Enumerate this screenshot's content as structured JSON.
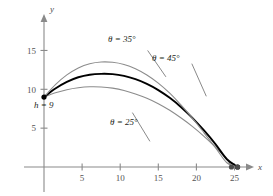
{
  "figure": {
    "axis_x_label": "x",
    "axis_y_label": "y",
    "axis_color": "#808080",
    "curve_highlight_color": "#000000",
    "curve_secondary_color": "#8c8c8c"
  },
  "annotations": {
    "height_label": "h = 9",
    "theta35": "θ = 35°",
    "theta45": "θ = 45°",
    "theta25": "θ = 25°"
  },
  "chart_data": {
    "type": "line",
    "title": "",
    "xlabel": "x",
    "ylabel": "y",
    "xlim": [
      0,
      27.5
    ],
    "ylim": [
      0,
      17.5
    ],
    "xticks": [
      5,
      10,
      15,
      20,
      25
    ],
    "yticks": [
      5,
      10,
      15
    ],
    "xtick_labels": [
      "5",
      "10",
      "15",
      "20",
      "25"
    ],
    "ytick_labels": [
      "5",
      "10",
      "15"
    ],
    "grid": false,
    "legend": "inline-annotations",
    "initial_height": 9,
    "series": [
      {
        "name": "θ = 25°",
        "color": "#8c8c8c",
        "emphasis": false,
        "x": [
          0,
          1.5,
          3,
          4.5,
          6,
          7.5,
          9,
          10.5,
          12,
          13.5,
          15,
          16.5,
          18,
          19.5,
          21,
          22.5,
          24,
          24.6
        ],
        "y": [
          9.0,
          9.55,
          9.95,
          10.2,
          10.32,
          10.3,
          10.15,
          9.85,
          9.4,
          8.85,
          8.15,
          7.3,
          6.3,
          5.2,
          3.95,
          2.55,
          1.0,
          0.0
        ],
        "apex": [
          6.4,
          10.33
        ],
        "landing_x": 24.6,
        "endpoint_marker": true
      },
      {
        "name": "θ = 45°",
        "color": "#000000",
        "emphasis": true,
        "x": [
          0,
          1.5,
          3,
          4.5,
          6,
          7.5,
          9,
          10.5,
          12,
          13.5,
          15,
          16.5,
          18,
          19.5,
          21,
          22.5,
          24,
          25.4
        ],
        "y": [
          9.0,
          10.1,
          10.95,
          11.55,
          11.88,
          11.99,
          11.95,
          11.72,
          11.3,
          10.7,
          9.9,
          8.9,
          7.7,
          6.3,
          4.7,
          2.95,
          1.0,
          0.0
        ],
        "apex": [
          8.2,
          12.0
        ],
        "landing_x": 25.4,
        "endpoint_marker": true
      },
      {
        "name": "θ = 35°",
        "color": "#8c8c8c",
        "emphasis": false,
        "x": [
          0,
          1.5,
          3,
          4.5,
          6,
          7.5,
          9,
          10.5,
          12,
          13.5,
          15,
          16.5,
          18,
          19.5,
          21,
          22.5,
          24,
          25.4
        ],
        "y": [
          9.0,
          10.6,
          11.85,
          12.75,
          13.3,
          13.52,
          13.48,
          13.2,
          12.65,
          11.85,
          10.8,
          9.5,
          7.95,
          6.25,
          4.4,
          2.5,
          0.55,
          0.0
        ],
        "apex": [
          8.4,
          13.52
        ],
        "landing_x": 25.4,
        "endpoint_marker": true
      }
    ],
    "leader_lines": [
      {
        "label": "θ = 35°",
        "from": [
          13.6,
          15.0
        ],
        "to": [
          16.0,
          11.6
        ]
      },
      {
        "label": "θ = 45°",
        "from": [
          19.4,
          13.3
        ],
        "to": [
          21.3,
          9.1
        ]
      },
      {
        "label": "θ = 25°",
        "from": [
          13.9,
          3.3
        ],
        "to": [
          11.6,
          7.0
        ]
      }
    ]
  }
}
